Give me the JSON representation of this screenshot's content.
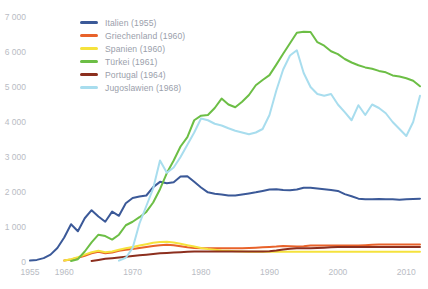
{
  "chart_data": {
    "type": "line",
    "title": "",
    "subtitle": "",
    "xlabel": "",
    "ylabel": "",
    "xlim": [
      1955,
      2012
    ],
    "ylim": [
      0,
      7000
    ],
    "grid": false,
    "legend_position": "top-left",
    "yticks": [
      0,
      1000,
      2000,
      3000,
      4000,
      5000,
      6000,
      7000
    ],
    "ytick_labels": [
      "0",
      "1 000",
      "2 000",
      "3 000",
      "4 000",
      "5 000",
      "6 000",
      "7 000"
    ],
    "xticks": [
      1955,
      1960,
      1970,
      1980,
      1990,
      2000,
      2010
    ],
    "xtick_labels": [
      "1955",
      "1960",
      "1970",
      "1980",
      "1990",
      "2000",
      "2010"
    ],
    "series": [
      {
        "name": "Italien (1955)",
        "color": "#3b5998",
        "x": [
          1955,
          1956,
          1957,
          1958,
          1959,
          1960,
          1961,
          1962,
          1963,
          1964,
          1965,
          1966,
          1967,
          1968,
          1969,
          1970,
          1971,
          1972,
          1973,
          1974,
          1975,
          1976,
          1977,
          1978,
          1979,
          1980,
          1981,
          1982,
          1983,
          1984,
          1985,
          1986,
          1987,
          1988,
          1989,
          1990,
          1991,
          1992,
          1993,
          1994,
          1995,
          1996,
          1997,
          1998,
          1999,
          2000,
          2001,
          2002,
          2003,
          2004,
          2005,
          2006,
          2007,
          2008,
          2009,
          2010,
          2011,
          2012
        ],
        "values": [
          40,
          60,
          110,
          210,
          400,
          700,
          1080,
          880,
          1250,
          1480,
          1300,
          1150,
          1440,
          1320,
          1680,
          1830,
          1870,
          1900,
          2140,
          2290,
          2250,
          2280,
          2440,
          2450,
          2290,
          2130,
          1990,
          1950,
          1930,
          1900,
          1900,
          1930,
          1960,
          1990,
          2030,
          2070,
          2080,
          2060,
          2050,
          2070,
          2120,
          2120,
          2100,
          2080,
          2060,
          2030,
          1940,
          1880,
          1810,
          1790,
          1790,
          1800,
          1790,
          1790,
          1780,
          1790,
          1800,
          1810
        ]
      },
      {
        "name": "Griechenland (1960)",
        "color": "#e8622a",
        "x": [
          1960,
          1961,
          1962,
          1963,
          1964,
          1965,
          1966,
          1967,
          1968,
          1969,
          1970,
          1971,
          1972,
          1973,
          1974,
          1975,
          1976,
          1977,
          1978,
          1979,
          1980,
          1981,
          1982,
          1983,
          1984,
          1985,
          1986,
          1987,
          1988,
          1989,
          1990,
          1991,
          1992,
          1993,
          1994,
          1995,
          1996,
          1997,
          1998,
          1999,
          2000,
          2001,
          2002,
          2003,
          2004,
          2005,
          2006,
          2007,
          2008,
          2009,
          2010,
          2011,
          2012
        ],
        "values": [
          40,
          70,
          120,
          180,
          250,
          290,
          250,
          270,
          320,
          350,
          370,
          400,
          430,
          460,
          480,
          490,
          480,
          450,
          420,
          400,
          390,
          390,
          390,
          390,
          390,
          390,
          390,
          400,
          410,
          420,
          430,
          440,
          460,
          450,
          440,
          450,
          470,
          470,
          470,
          470,
          470,
          470,
          470,
          470,
          480,
          490,
          500,
          500,
          500,
          500,
          500,
          500,
          500
        ]
      },
      {
        "name": "Spanien (1960)",
        "color": "#f5e23c",
        "x": [
          1960,
          1961,
          1962,
          1963,
          1964,
          1965,
          1966,
          1967,
          1968,
          1969,
          1970,
          1971,
          1972,
          1973,
          1974,
          1975,
          1976,
          1977,
          1978,
          1979,
          1980,
          1981,
          1982,
          1983,
          1984,
          1985,
          1986,
          1987,
          1988,
          1989,
          1990,
          1991,
          1992,
          1993,
          1994,
          1995,
          1996,
          1997,
          1998,
          1999,
          2000,
          2001,
          2002,
          2003,
          2004,
          2005,
          2006,
          2007,
          2008,
          2009,
          2010,
          2011,
          2012
        ],
        "values": [
          40,
          80,
          140,
          210,
          280,
          320,
          280,
          300,
          350,
          390,
          430,
          470,
          510,
          550,
          570,
          580,
          560,
          520,
          480,
          440,
          400,
          370,
          350,
          330,
          320,
          310,
          300,
          290,
          290,
          290,
          290,
          290,
          290,
          290,
          290,
          290,
          290,
          290,
          290,
          290,
          290,
          290,
          290,
          290,
          290,
          290,
          290,
          290,
          290,
          290,
          290,
          290,
          290
        ]
      },
      {
        "name": "Türkei (1961)",
        "color": "#6cbe45",
        "x": [
          1961,
          1962,
          1963,
          1964,
          1965,
          1966,
          1967,
          1968,
          1969,
          1970,
          1971,
          1972,
          1973,
          1974,
          1975,
          1976,
          1977,
          1978,
          1979,
          1980,
          1981,
          1982,
          1983,
          1984,
          1985,
          1986,
          1987,
          1988,
          1989,
          1990,
          1991,
          1992,
          1993,
          1994,
          1995,
          1996,
          1997,
          1998,
          1999,
          2000,
          2001,
          2002,
          2003,
          2004,
          2005,
          2006,
          2007,
          2008,
          2009,
          2010,
          2011,
          2012
        ],
        "values": [
          30,
          80,
          300,
          560,
          780,
          740,
          640,
          780,
          1050,
          1150,
          1280,
          1430,
          1700,
          2080,
          2540,
          2900,
          3300,
          3570,
          4050,
          4180,
          4200,
          4400,
          4670,
          4500,
          4420,
          4580,
          4770,
          5050,
          5200,
          5340,
          5640,
          5950,
          6250,
          6550,
          6580,
          6570,
          6280,
          6180,
          6020,
          5940,
          5800,
          5700,
          5620,
          5560,
          5520,
          5460,
          5420,
          5330,
          5300,
          5250,
          5180,
          5020
        ]
      },
      {
        "name": "Portugal (1964)",
        "color": "#8c2f1e",
        "x": [
          1964,
          1965,
          1966,
          1967,
          1968,
          1969,
          1970,
          1971,
          1972,
          1973,
          1974,
          1975,
          1976,
          1977,
          1978,
          1979,
          1980,
          1981,
          1982,
          1983,
          1984,
          1985,
          1986,
          1987,
          1988,
          1989,
          1990,
          1991,
          1992,
          1993,
          1994,
          1995,
          1996,
          1997,
          1998,
          1999,
          2000,
          2001,
          2002,
          2003,
          2004,
          2005,
          2006,
          2007,
          2008,
          2009,
          2010,
          2011,
          2012
        ],
        "values": [
          30,
          60,
          90,
          110,
          130,
          150,
          170,
          190,
          210,
          230,
          250,
          260,
          270,
          280,
          290,
          300,
          300,
          300,
          300,
          300,
          300,
          300,
          300,
          300,
          300,
          300,
          310,
          330,
          360,
          380,
          390,
          390,
          390,
          400,
          410,
          420,
          430,
          430,
          430,
          430,
          430,
          430,
          430,
          430,
          430,
          430,
          430,
          430,
          430
        ]
      },
      {
        "name": "Jugoslawien (1968)",
        "color": "#a8ddee",
        "x": [
          1968,
          1969,
          1970,
          1971,
          1972,
          1973,
          1974,
          1975,
          1976,
          1977,
          1978,
          1979,
          1980,
          1981,
          1982,
          1983,
          1984,
          1985,
          1986,
          1987,
          1988,
          1989,
          1990,
          1991,
          1992,
          1993,
          1994,
          1995,
          1996,
          1997,
          1998,
          1999,
          2000,
          2001,
          2002,
          2003,
          2004,
          2005,
          2006,
          2007,
          2008,
          2009,
          2010,
          2011,
          2012
        ],
        "values": [
          40,
          120,
          400,
          1100,
          1600,
          2100,
          2900,
          2550,
          2700,
          3000,
          3350,
          3700,
          4100,
          4050,
          3950,
          3900,
          3820,
          3750,
          3700,
          3650,
          3700,
          3800,
          4200,
          4900,
          5500,
          5900,
          6050,
          5400,
          5000,
          4800,
          4750,
          4800,
          4500,
          4280,
          4050,
          4480,
          4200,
          4500,
          4400,
          4250,
          4000,
          3800,
          3600,
          4000,
          4750
        ]
      }
    ]
  },
  "legend": {
    "items": [
      {
        "label": "Italien (1955)",
        "color": "#3b5998"
      },
      {
        "label": "Griechenland (1960)",
        "color": "#e8622a"
      },
      {
        "label": "Spanien (1960)",
        "color": "#f5e23c"
      },
      {
        "label": "Türkei (1961)",
        "color": "#6cbe45"
      },
      {
        "label": "Portugal (1964)",
        "color": "#8c2f1e"
      },
      {
        "label": "Jugoslawien (1968)",
        "color": "#a8ddee"
      }
    ]
  }
}
